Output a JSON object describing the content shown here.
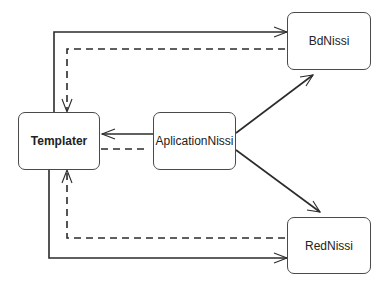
{
  "diagram": {
    "type": "component-dependency",
    "nodes": [
      {
        "id": "templater",
        "label": "Templater"
      },
      {
        "id": "app",
        "label": "AplicationNissi"
      },
      {
        "id": "bd",
        "label": "BdNissi"
      },
      {
        "id": "red",
        "label": "RedNissi"
      }
    ],
    "edges": [
      {
        "from": "templater",
        "to": "bd",
        "style": "solid",
        "arrow": "open"
      },
      {
        "from": "bd",
        "to": "templater",
        "style": "dashed",
        "arrow": "open"
      },
      {
        "from": "app",
        "to": "templater",
        "style": "solid",
        "arrow": "open"
      },
      {
        "from": "app",
        "to": "templater",
        "style": "dashed",
        "arrow": "none"
      },
      {
        "from": "app",
        "to": "bd",
        "style": "solid",
        "arrow": "open"
      },
      {
        "from": "app",
        "to": "red",
        "style": "solid",
        "arrow": "open"
      },
      {
        "from": "red",
        "to": "templater",
        "style": "dashed",
        "arrow": "open"
      },
      {
        "from": "templater",
        "to": "red",
        "style": "solid",
        "arrow": "open"
      }
    ],
    "colors": {
      "line": "#2b2b2b",
      "box_border": "#4a4a4a",
      "background": "#ffffff"
    }
  }
}
